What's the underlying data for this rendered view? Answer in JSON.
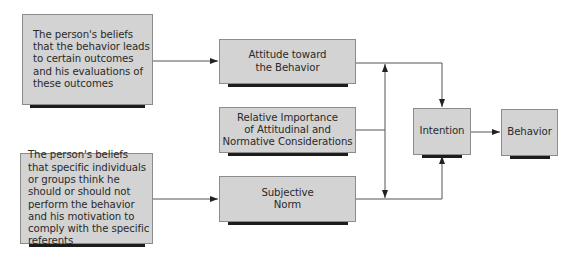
{
  "diagram": {
    "type": "theory-of-reasoned-action-flow",
    "colors": {
      "box_fill": "#d3d3d3",
      "box_border": "#8c8c8c",
      "shadow": "#1c1c1c",
      "line": "#555555"
    },
    "nodes": {
      "beliefs_outcomes": {
        "label": "The person's beliefs that the behavior leads to certain outcomes and his evaluations of these outcomes"
      },
      "beliefs_referents": {
        "label": "The person's beliefs that specific individuals or groups think he should or should not perform the behavior and his motivation to comply with the specific referents"
      },
      "attitude": {
        "line1": "Attitude toward",
        "line2": "the Behavior"
      },
      "relative_importance": {
        "line1": "Relative Importance",
        "line2": "of Attitudinal and",
        "line3": "Normative Considerations"
      },
      "subjective_norm": {
        "line1": "Subjective",
        "line2": "Norm"
      },
      "intention": {
        "label": "Intention"
      },
      "behavior": {
        "label": "Behavior"
      }
    },
    "edges": [
      {
        "from": "beliefs_outcomes",
        "to": "attitude"
      },
      {
        "from": "beliefs_referents",
        "to": "subjective_norm"
      },
      {
        "from": "attitude",
        "to": "intention"
      },
      {
        "from": "subjective_norm",
        "to": "intention"
      },
      {
        "from": "relative_importance",
        "to": "attitude"
      },
      {
        "from": "relative_importance",
        "to": "subjective_norm"
      },
      {
        "from": "intention",
        "to": "behavior"
      }
    ]
  }
}
